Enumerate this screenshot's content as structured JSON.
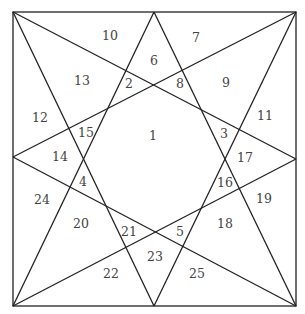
{
  "diagram": {
    "type": "square-star-partition",
    "stroke_color": "#222222",
    "label_color": "#444444",
    "square": {
      "x1": 13,
      "y1": 12,
      "x2": 296,
      "y2": 306
    },
    "lines": [
      {
        "from": [
          13,
          12
        ],
        "to": [
          154,
          306
        ]
      },
      {
        "from": [
          13,
          12
        ],
        "to": [
          296,
          159
        ]
      },
      {
        "from": [
          296,
          12
        ],
        "to": [
          13,
          157
        ]
      },
      {
        "from": [
          296,
          12
        ],
        "to": [
          154,
          306
        ]
      },
      {
        "from": [
          13,
          306
        ],
        "to": [
          154,
          12
        ]
      },
      {
        "from": [
          13,
          306
        ],
        "to": [
          296,
          159
        ]
      },
      {
        "from": [
          296,
          306
        ],
        "to": [
          154,
          12
        ]
      },
      {
        "from": [
          296,
          306
        ],
        "to": [
          13,
          157
        ]
      }
    ],
    "regions": [
      {
        "label": "1",
        "x": 153,
        "y": 136
      },
      {
        "label": "2",
        "x": 129,
        "y": 84
      },
      {
        "label": "3",
        "x": 224,
        "y": 134
      },
      {
        "label": "4",
        "x": 83,
        "y": 182
      },
      {
        "label": "5",
        "x": 180,
        "y": 232
      },
      {
        "label": "6",
        "x": 154,
        "y": 61
      },
      {
        "label": "7",
        "x": 196,
        "y": 38
      },
      {
        "label": "8",
        "x": 180,
        "y": 84
      },
      {
        "label": "9",
        "x": 226,
        "y": 83
      },
      {
        "label": "10",
        "x": 110,
        "y": 36
      },
      {
        "label": "11",
        "x": 265,
        "y": 116
      },
      {
        "label": "12",
        "x": 40,
        "y": 118
      },
      {
        "label": "13",
        "x": 82,
        "y": 81
      },
      {
        "label": "14",
        "x": 60,
        "y": 157
      },
      {
        "label": "15",
        "x": 86,
        "y": 133
      },
      {
        "label": "16",
        "x": 225,
        "y": 183
      },
      {
        "label": "17",
        "x": 245,
        "y": 158
      },
      {
        "label": "18",
        "x": 225,
        "y": 224
      },
      {
        "label": "19",
        "x": 264,
        "y": 199
      },
      {
        "label": "20",
        "x": 81,
        "y": 224
      },
      {
        "label": "21",
        "x": 129,
        "y": 232
      },
      {
        "label": "22",
        "x": 111,
        "y": 274
      },
      {
        "label": "23",
        "x": 155,
        "y": 257
      },
      {
        "label": "24",
        "x": 42,
        "y": 200
      },
      {
        "label": "25",
        "x": 197,
        "y": 274
      }
    ]
  }
}
